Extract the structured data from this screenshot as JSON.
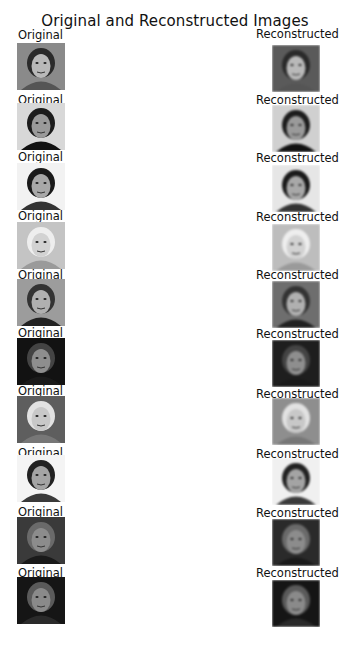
{
  "figure": {
    "title": "Original and Reconstructed Images",
    "rows": [
      {
        "original_label": "Original",
        "reconstructed_label": "Reconstructed",
        "bg": "#8a8a8a",
        "hair": "#2a2a2a",
        "skin": "#b9b9b9",
        "shirt": "#555555",
        "rbg": "#5a5a5a"
      },
      {
        "original_label": "Original",
        "reconstructed_label": "Reconstructed",
        "bg": "#d8d8d8",
        "hair": "#1c1c1c",
        "skin": "#9a9a9a",
        "shirt": "#111111",
        "rbg": "#d0d0d0"
      },
      {
        "original_label": "Original",
        "reconstructed_label": "Reconstructed",
        "bg": "#f2f2f2",
        "hair": "#1a1a1a",
        "skin": "#a8a8a8",
        "shirt": "#333333",
        "rbg": "#e6e6e6"
      },
      {
        "original_label": "Original",
        "reconstructed_label": "Reconstructed",
        "bg": "#c4c4c4",
        "hair": "#eeeeee",
        "skin": "#d2d2d2",
        "shirt": "#9a9a9a",
        "rbg": "#bdbdbd"
      },
      {
        "original_label": "Original",
        "reconstructed_label": "Reconstructed",
        "bg": "#9c9c9c",
        "hair": "#333333",
        "skin": "#b0b0b0",
        "shirt": "#222222",
        "rbg": "#6e6e6e"
      },
      {
        "original_label": "Original",
        "reconstructed_label": "Reconstructed",
        "bg": "#121212",
        "hair": "#444444",
        "skin": "#8e8e8e",
        "shirt": "#1a1a1a",
        "rbg": "#1e1e1e"
      },
      {
        "original_label": "Original",
        "reconstructed_label": "Reconstructed",
        "bg": "#5e5e5e",
        "hair": "#e2e2e2",
        "skin": "#c8c8c8",
        "shirt": "#777777",
        "rbg": "#8e8e8e"
      },
      {
        "original_label": "Original",
        "reconstructed_label": "Reconstructed",
        "bg": "#f4f4f4",
        "hair": "#222222",
        "skin": "#a4a4a4",
        "shirt": "#3a3a3a",
        "rbg": "#f0f0f0"
      },
      {
        "original_label": "Original",
        "reconstructed_label": "Reconstructed",
        "bg": "#3a3a3a",
        "hair": "#6a6a6a",
        "skin": "#8c8c8c",
        "shirt": "#1a1a1a",
        "rbg": "#2a2a2a"
      },
      {
        "original_label": "Original",
        "reconstructed_label": "",
        "bg": "#151515",
        "hair": "#5a5a5a",
        "skin": "#8a8a8a",
        "shirt": "#2a2a2a",
        "rbg": "#151515"
      }
    ]
  },
  "tenth_reconstructed_label": "Reconstructed"
}
